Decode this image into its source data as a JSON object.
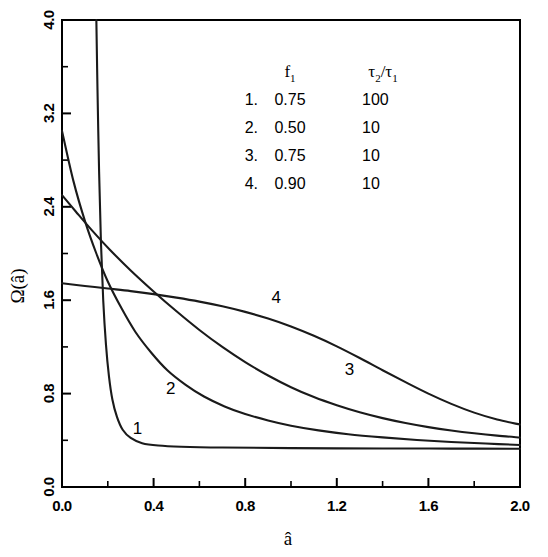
{
  "chart_data": {
    "type": "line",
    "title": "",
    "xlabel": "â",
    "ylabel": "Ω(â)",
    "xlim": [
      0.0,
      2.0
    ],
    "ylim": [
      0.0,
      4.0
    ],
    "xticks": [
      "0.0",
      "0.4",
      "0.8",
      "1.2",
      "1.6",
      "2.0"
    ],
    "xtick_values": [
      0.0,
      0.4,
      0.8,
      1.2,
      1.6,
      2.0
    ],
    "yticks": [
      "0.0",
      "0.8",
      "1.6",
      "2.4",
      "3.2",
      "4.0"
    ],
    "ytick_values": [
      0.0,
      0.8,
      1.6,
      2.4,
      3.2,
      4.0
    ],
    "minor_tick_step_x": 0.2,
    "minor_tick_step_y": 0.4,
    "grid": false,
    "legend_position": "upper-center-right",
    "series": [
      {
        "name": "1",
        "label": "1",
        "f1": "0.75",
        "tau_ratio": "100",
        "label_xy": [
          0.33,
          0.45
        ],
        "points": [
          [
            0.15,
            4.0
          ],
          [
            0.155,
            3.4
          ],
          [
            0.162,
            2.7
          ],
          [
            0.17,
            2.1
          ],
          [
            0.18,
            1.6
          ],
          [
            0.192,
            1.22
          ],
          [
            0.205,
            0.95
          ],
          [
            0.22,
            0.75
          ],
          [
            0.24,
            0.6
          ],
          [
            0.265,
            0.49
          ],
          [
            0.3,
            0.42
          ],
          [
            0.35,
            0.375
          ],
          [
            0.42,
            0.355
          ],
          [
            0.52,
            0.345
          ],
          [
            0.7,
            0.338
          ],
          [
            1.0,
            0.333
          ],
          [
            1.4,
            0.33
          ],
          [
            1.7,
            0.329
          ],
          [
            2.0,
            0.328
          ]
        ]
      },
      {
        "name": "2",
        "label": "2",
        "f1": "0.50",
        "tau_ratio": "10",
        "label_xy": [
          0.475,
          0.8
        ],
        "points": [
          [
            0.0,
            3.05
          ],
          [
            0.05,
            2.62
          ],
          [
            0.1,
            2.28
          ],
          [
            0.15,
            2.0
          ],
          [
            0.2,
            1.76
          ],
          [
            0.26,
            1.53
          ],
          [
            0.32,
            1.33
          ],
          [
            0.39,
            1.15
          ],
          [
            0.46,
            1.0
          ],
          [
            0.54,
            0.875
          ],
          [
            0.62,
            0.775
          ],
          [
            0.71,
            0.69
          ],
          [
            0.8,
            0.625
          ],
          [
            0.9,
            0.57
          ],
          [
            1.0,
            0.525
          ],
          [
            1.12,
            0.485
          ],
          [
            1.25,
            0.452
          ],
          [
            1.4,
            0.425
          ],
          [
            1.55,
            0.403
          ],
          [
            1.7,
            0.386
          ],
          [
            1.85,
            0.372
          ],
          [
            2.0,
            0.36
          ]
        ]
      },
      {
        "name": "3",
        "label": "3",
        "f1": "0.75",
        "tau_ratio": "10",
        "label_xy": [
          1.255,
          0.96
        ],
        "points": [
          [
            0.0,
            2.5
          ],
          [
            0.06,
            2.36
          ],
          [
            0.13,
            2.2
          ],
          [
            0.21,
            2.03
          ],
          [
            0.3,
            1.855
          ],
          [
            0.4,
            1.675
          ],
          [
            0.5,
            1.505
          ],
          [
            0.6,
            1.345
          ],
          [
            0.7,
            1.2
          ],
          [
            0.8,
            1.07
          ],
          [
            0.9,
            0.955
          ],
          [
            1.0,
            0.855
          ],
          [
            1.1,
            0.77
          ],
          [
            1.2,
            0.7
          ],
          [
            1.3,
            0.64
          ],
          [
            1.4,
            0.59
          ],
          [
            1.5,
            0.548
          ],
          [
            1.6,
            0.513
          ],
          [
            1.7,
            0.484
          ],
          [
            1.8,
            0.46
          ],
          [
            1.9,
            0.44
          ],
          [
            2.0,
            0.424
          ]
        ]
      },
      {
        "name": "4",
        "label": "4",
        "f1": "0.90",
        "tau_ratio": "10",
        "label_xy": [
          0.935,
          1.58
        ],
        "points": [
          [
            0.0,
            1.745
          ],
          [
            0.1,
            1.722
          ],
          [
            0.2,
            1.7
          ],
          [
            0.3,
            1.678
          ],
          [
            0.4,
            1.652
          ],
          [
            0.5,
            1.622
          ],
          [
            0.6,
            1.588
          ],
          [
            0.7,
            1.548
          ],
          [
            0.8,
            1.5
          ],
          [
            0.9,
            1.443
          ],
          [
            1.0,
            1.375
          ],
          [
            1.1,
            1.295
          ],
          [
            1.2,
            1.205
          ],
          [
            1.3,
            1.105
          ],
          [
            1.4,
            1.0
          ],
          [
            1.5,
            0.898
          ],
          [
            1.6,
            0.8
          ],
          [
            1.7,
            0.712
          ],
          [
            1.8,
            0.637
          ],
          [
            1.9,
            0.578
          ],
          [
            2.0,
            0.535
          ]
        ]
      }
    ]
  },
  "legend": {
    "header_index": "",
    "header_f1_base": "f",
    "header_f1_sub": "1",
    "header_tau_num_base": "τ",
    "header_tau_num_sub": "2",
    "header_tau_slash": "/",
    "header_tau_den_base": "τ",
    "header_tau_den_sub": "1",
    "rows": [
      {
        "index": "1.",
        "f1": "0.75",
        "ratio": "100"
      },
      {
        "index": "2.",
        "f1": "0.50",
        "ratio": "10"
      },
      {
        "index": "3.",
        "f1": "0.75",
        "ratio": "10"
      },
      {
        "index": "4.",
        "f1": "0.90",
        "ratio": "10"
      }
    ]
  },
  "axes": {
    "y_title_omega": "Ω",
    "y_title_open": "(",
    "y_title_var": "â",
    "y_title_close": ")",
    "x_title": "â"
  },
  "colors": {
    "ink": "#1a1a1a",
    "background": "#ffffff"
  }
}
